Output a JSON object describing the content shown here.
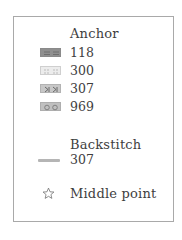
{
  "legend": {
    "anchor_heading": "Anchor",
    "anchor_items": [
      {
        "code": "118",
        "swatch": "double-dash-symbol",
        "color": "#8f8f8f"
      },
      {
        "code": "300",
        "swatch": "dotted-grid-symbol",
        "color": "#ececec"
      },
      {
        "code": "307",
        "swatch": "arrow-k-symbol",
        "color": "#c7c7c7"
      },
      {
        "code": "969",
        "swatch": "double-circle-symbol",
        "color": "#c0c0c0"
      }
    ],
    "backstitch_heading": "Backstitch",
    "backstitch_items": [
      {
        "code": "307",
        "line_color": "#b5b5b5"
      }
    ],
    "middle_point": {
      "icon": "star-outline-icon",
      "label": "Middle point"
    }
  }
}
